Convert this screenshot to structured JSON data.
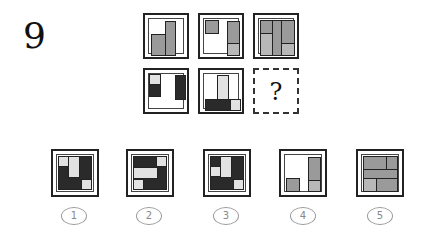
{
  "question": {
    "number": "9",
    "missing_symbol": "?"
  },
  "grid": {
    "rows": 2,
    "cols": 3,
    "cells": [
      {
        "id": "r1c1",
        "description": "two grey bars, short left, tall right"
      },
      {
        "id": "r1c2",
        "description": "small grey square top-left, tall grey bar right with light grey bottom segment"
      },
      {
        "id": "r1c3",
        "description": "three columns of grey rectangles with split segments"
      },
      {
        "id": "r2c1",
        "description": "left: light square over dark square; right: tall dark bar"
      },
      {
        "id": "r2c2",
        "description": "tall light bar center on top of dark bottom strip with light square right"
      },
      {
        "id": "r2c3",
        "description": "missing",
        "missing": true
      }
    ]
  },
  "options": [
    {
      "label": "1"
    },
    {
      "label": "2"
    },
    {
      "label": "3"
    },
    {
      "label": "4"
    },
    {
      "label": "5"
    }
  ]
}
